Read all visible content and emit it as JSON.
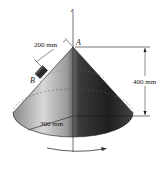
{
  "figure": {
    "axis_label": "z",
    "apex_label": "A",
    "block_label": "B",
    "slant_distance": "200 mm",
    "height": "400 mm",
    "base_radius": "300 mm",
    "rotation_indicator": "rotation-arrow"
  },
  "colors": {
    "cone_light": "#d9d9d9",
    "cone_dark": "#2b2b2b",
    "lines": "#1a1a1a",
    "background": "#ffffff"
  }
}
